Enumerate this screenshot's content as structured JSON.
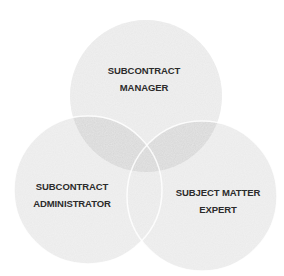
{
  "diagram": {
    "type": "venn",
    "circles": [
      {
        "id": "manager",
        "label_line1": "SUBCONTRACT",
        "label_line2": "MANAGER",
        "cx": 146,
        "cy": 96,
        "r": 76
      },
      {
        "id": "administrator",
        "label_line1": "SUBCONTRACT",
        "label_line2": "ADMINISTRATOR",
        "cx": 88,
        "cy": 190,
        "r": 74
      },
      {
        "id": "sme",
        "label_line1": "SUBJECT MATTER",
        "label_line2": "EXPERT",
        "cx": 202,
        "cy": 196,
        "r": 75
      }
    ],
    "colors": {
      "circle_fill": "#e6e6e6",
      "overlap_fill": "#d4d4d4",
      "stroke": "#ffffff",
      "text": "#2b2b2b"
    }
  }
}
